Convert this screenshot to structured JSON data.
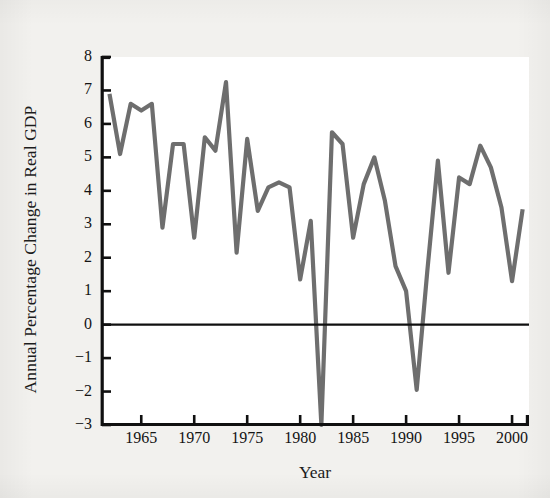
{
  "chart_data": {
    "type": "line",
    "title": "",
    "xlabel": "Year",
    "ylabel": "Annual Percentage Change in Real GDP",
    "xlim": [
      1961.2,
      2001.6
    ],
    "ylim": [
      -3,
      8
    ],
    "grid": false,
    "legend": null,
    "legend_position": "none",
    "zero_line": 0,
    "line_color": "#6e6e6e",
    "axis_color": "#101010",
    "background_color": "#ffffff",
    "page_color": "#f2f1ee",
    "y_ticks": [
      -3,
      -2,
      -1,
      0,
      1,
      2,
      3,
      4,
      5,
      6,
      7,
      8
    ],
    "y_tick_labels": [
      "−3",
      "−2",
      "−1",
      "0",
      "1",
      "2",
      "3",
      "4",
      "5",
      "6",
      "7",
      "8"
    ],
    "x_ticks": [
      1965,
      1970,
      1975,
      1980,
      1985,
      1990,
      1995,
      2000
    ],
    "x_tick_labels": [
      "1965",
      "1970",
      "1975",
      "1980",
      "1985",
      "1990",
      "1995",
      "2000"
    ],
    "x": [
      1962,
      1963,
      1964,
      1965,
      1966,
      1967,
      1968,
      1969,
      1970,
      1971,
      1972,
      1973,
      1974,
      1975,
      1976,
      1977,
      1978,
      1979,
      1980,
      1981,
      1982,
      1983,
      1984,
      1985,
      1986,
      1987,
      1988,
      1989,
      1990,
      1991,
      1992,
      1993,
      1994,
      1995,
      1996,
      1997,
      1998,
      1999,
      2000,
      2001
    ],
    "values": [
      6.9,
      5.1,
      6.6,
      6.4,
      6.6,
      2.9,
      5.4,
      5.4,
      2.6,
      5.6,
      5.2,
      7.25,
      2.15,
      5.55,
      3.4,
      4.1,
      4.25,
      4.1,
      1.35,
      3.1,
      -3.5,
      5.75,
      5.4,
      2.6,
      4.2,
      5.0,
      3.7,
      1.75,
      1.0,
      -1.95,
      1.6,
      4.9,
      1.55,
      4.4,
      4.2,
      5.35,
      4.7,
      3.5,
      1.3,
      3.45
    ],
    "series_name": "Annual percentage change in real GDP"
  },
  "axis_labels": {
    "y": "Annual Percentage Change in Real GDP",
    "x": "Year"
  }
}
